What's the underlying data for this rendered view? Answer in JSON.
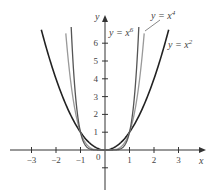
{
  "chart_data": {
    "type": "line",
    "title": "",
    "xlabel": "x",
    "ylabel": "y",
    "xlim": [
      -3.6,
      4
    ],
    "ylim": [
      -1.8,
      7.2
    ],
    "x_ticks": [
      -3,
      -2,
      -1,
      0,
      1,
      2,
      3
    ],
    "y_ticks": [
      1,
      2,
      3,
      4,
      5,
      6
    ],
    "x_tick_labels": [
      "−3",
      "−2",
      "−1",
      "0",
      "1",
      "2",
      "3"
    ],
    "y_tick_labels": [
      "1",
      "2",
      "3",
      "4",
      "5",
      "6"
    ],
    "grid": false,
    "series": [
      {
        "name": "y = x²",
        "function": "x^2",
        "color": "#222222",
        "x": [
          -2.6,
          -2,
          -1,
          0,
          1,
          2,
          2.6
        ],
        "values": [
          6.76,
          4,
          1,
          0,
          1,
          4,
          6.76
        ]
      },
      {
        "name": "y = x⁴",
        "function": "x^4",
        "color": "#999999",
        "x": [
          -1.6,
          -1,
          0,
          1,
          1.6
        ],
        "values": [
          6.55,
          1,
          0,
          1,
          6.55
        ]
      },
      {
        "name": "y = x⁶",
        "function": "x^6",
        "color": "#555555",
        "x": [
          -1.38,
          -1,
          0,
          1,
          1.38
        ],
        "values": [
          6.9,
          1,
          0,
          1,
          6.9
        ]
      }
    ],
    "annotations": [
      "y = x⁶",
      "y = x⁴",
      "y = x²"
    ]
  },
  "labels": {
    "x_axis": "x",
    "y_axis": "y",
    "origin": "0",
    "x2": "y = x",
    "x2_exp": "2",
    "x4": "y = x",
    "x4_exp": "4",
    "x6": "y = x",
    "x6_exp": "6"
  }
}
